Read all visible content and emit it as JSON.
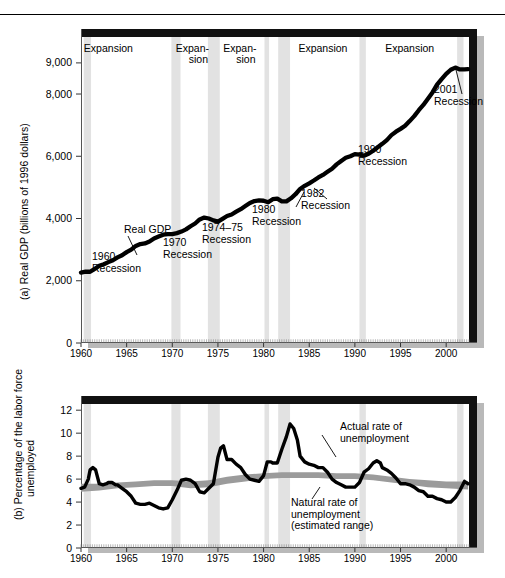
{
  "figure": {
    "top_rule": true,
    "panels": [
      "a",
      "b"
    ]
  },
  "panel_a": {
    "axis_label": "(a) Real GDP (billions  of 1996 dollars)",
    "y_ticks": [
      "0",
      "2,000",
      "4,000",
      "6,000",
      "8,000",
      "9,000"
    ],
    "y_tick_values": [
      0,
      2000,
      4000,
      6000,
      8000,
      9000
    ],
    "x_ticks": [
      "1960",
      "1965",
      "1970",
      "1975",
      "1980",
      "1985",
      "1990",
      "1995",
      "2000"
    ],
    "x_tick_values": [
      1960,
      1965,
      1970,
      1975,
      1980,
      1985,
      1990,
      1995,
      2000
    ],
    "series_label": "Real GDP",
    "expansion_labels": [
      {
        "text": "Expansion",
        "two_line": false,
        "year": 1963.0
      },
      {
        "text": "Expan-\nsion",
        "two_line": true,
        "year": 1972.2
      },
      {
        "text": "Expan-\nsion",
        "two_line": true,
        "year": 1977.4
      },
      {
        "text": "Expansion",
        "two_line": false,
        "year": 1986.5
      },
      {
        "text": "Expansion",
        "two_line": false,
        "year": 1996.0
      }
    ],
    "recession_callouts": [
      {
        "label": "1960\nRecession",
        "line1": "1960",
        "line2": "Recession"
      },
      {
        "label": "1970\nRecession",
        "line1": "1970",
        "line2": "Recession"
      },
      {
        "label": "1974–75\nRecession",
        "line1": "1974–75",
        "line2": "Recession"
      },
      {
        "label": "1980\nRecession",
        "line1": "1980",
        "line2": "Recession"
      },
      {
        "label": "1982\nRecession",
        "line1": "1982",
        "line2": "Recession"
      },
      {
        "label": "1990\nRecession",
        "line1": "1990",
        "line2": "Recession"
      },
      {
        "label": "2001\nRecession",
        "line1": "2001",
        "line2": "Recession"
      }
    ]
  },
  "panel_b": {
    "axis_label": "(b) Percentage of the labor force\nunemployed",
    "axis_label_line1": "(b) Percentage of the labor force",
    "axis_label_line2": "unemployed",
    "y_ticks": [
      "0",
      "2",
      "4",
      "6",
      "8",
      "10",
      "12"
    ],
    "y_tick_values": [
      0,
      2,
      4,
      6,
      8,
      10,
      12
    ],
    "x_ticks": [
      "1960",
      "1965",
      "1970",
      "1975",
      "1980",
      "1985",
      "1990",
      "1995",
      "2000"
    ],
    "x_tick_values": [
      1960,
      1965,
      1970,
      1975,
      1980,
      1985,
      1990,
      1995,
      2000
    ],
    "actual_label_line1": "Actual rate of",
    "actual_label_line2": "unemployment",
    "natural_label_line1": "Natural rate of",
    "natural_label_line2": "unemployment",
    "natural_label_line3": "(estimated range)"
  },
  "colors": {
    "line": "#000000",
    "recession_band": "#e2e2e2",
    "natural_band": "#9b9b9b",
    "frame": "#000000",
    "shadow": "#b4b4b4",
    "background": "#ffffff"
  },
  "recession_bands": [
    {
      "name": "1960 Recession",
      "start": 1960.3,
      "end": 1961.1
    },
    {
      "name": "1970 Recession",
      "start": 1969.9,
      "end": 1970.9
    },
    {
      "name": "1974–75 Recession",
      "start": 1973.9,
      "end": 1975.2
    },
    {
      "name": "1980 Recession",
      "start": 1980.1,
      "end": 1980.6
    },
    {
      "name": "1982 Recession",
      "start": 1981.6,
      "end": 1982.9
    },
    {
      "name": "1990 Recession",
      "start": 1990.5,
      "end": 1991.2
    },
    {
      "name": "2001 Recession",
      "start": 2001.2,
      "end": 2001.9
    }
  ],
  "chart_data": [
    {
      "type": "line",
      "id": "real-gdp",
      "title": "(a) Real GDP (billions of 1996 dollars)",
      "xlabel": "",
      "ylabel": "Real GDP (billions of 1996 dollars)",
      "xlim": [
        1960,
        2002.5
      ],
      "ylim": [
        0,
        9800
      ],
      "grid": false,
      "legend": "none",
      "series": [
        {
          "name": "Real GDP",
          "x": [
            1960.0,
            1960.5,
            1961.0,
            1961.5,
            1962.0,
            1962.5,
            1963.0,
            1963.5,
            1964.0,
            1964.5,
            1965.0,
            1965.5,
            1966.0,
            1966.5,
            1967.0,
            1967.5,
            1968.0,
            1968.5,
            1969.0,
            1969.5,
            1970.0,
            1970.5,
            1971.0,
            1971.5,
            1972.0,
            1972.5,
            1973.0,
            1973.5,
            1974.0,
            1974.5,
            1975.0,
            1975.5,
            1976.0,
            1976.5,
            1977.0,
            1977.5,
            1978.0,
            1978.5,
            1979.0,
            1979.5,
            1980.0,
            1980.5,
            1981.0,
            1981.5,
            1982.0,
            1982.5,
            1983.0,
            1983.5,
            1984.0,
            1984.5,
            1985.0,
            1985.5,
            1986.0,
            1986.5,
            1987.0,
            1987.5,
            1988.0,
            1988.5,
            1989.0,
            1989.5,
            1990.0,
            1990.5,
            1991.0,
            1991.5,
            1992.0,
            1992.5,
            1993.0,
            1993.5,
            1994.0,
            1994.5,
            1995.0,
            1995.5,
            1996.0,
            1996.5,
            1997.0,
            1997.5,
            1998.0,
            1998.5,
            1999.0,
            1999.5,
            2000.0,
            2000.5,
            2001.0,
            2001.5,
            2002.0,
            2002.4
          ],
          "y": [
            2263,
            2290,
            2290,
            2380,
            2480,
            2530,
            2600,
            2660,
            2750,
            2820,
            2920,
            3000,
            3120,
            3180,
            3200,
            3260,
            3360,
            3420,
            3480,
            3500,
            3500,
            3530,
            3580,
            3650,
            3750,
            3840,
            3970,
            4030,
            4000,
            3940,
            3900,
            3990,
            4080,
            4130,
            4220,
            4300,
            4400,
            4500,
            4560,
            4580,
            4570,
            4520,
            4620,
            4640,
            4550,
            4550,
            4650,
            4780,
            4950,
            5050,
            5130,
            5220,
            5320,
            5400,
            5500,
            5600,
            5740,
            5850,
            5950,
            6000,
            6070,
            6050,
            6020,
            6080,
            6180,
            6290,
            6400,
            6520,
            6680,
            6790,
            6880,
            6980,
            7130,
            7290,
            7480,
            7650,
            7850,
            8050,
            8300,
            8480,
            8650,
            8780,
            8850,
            8790,
            8790,
            8800
          ]
        }
      ],
      "annotations": [
        {
          "text": "Expansion",
          "x": 1963.0,
          "y_area": "top"
        },
        {
          "text": "Expan- sion",
          "x": 1972.2,
          "y_area": "top"
        },
        {
          "text": "Expan- sion",
          "x": 1977.4,
          "y_area": "top"
        },
        {
          "text": "Expansion",
          "x": 1986.5,
          "y_area": "top"
        },
        {
          "text": "Expansion",
          "x": 1996.0,
          "y_area": "top"
        },
        {
          "text": "Real GDP",
          "x": 1963.0,
          "y": 4000
        },
        {
          "text": "1960 Recession",
          "x": 1960.8,
          "y": 1500
        },
        {
          "text": "1970 Recession",
          "x": 1970.6,
          "y": 2700
        },
        {
          "text": "1974-75 Recession",
          "x": 1974.6,
          "y": 3350
        },
        {
          "text": "1980 Recession",
          "x": 1980.6,
          "y": 4150
        },
        {
          "text": "1982 Recession",
          "x": 1983.5,
          "y": 4500
        },
        {
          "text": "1990 Recession",
          "x": 1991.0,
          "y": 5700
        },
        {
          "text": "2001 Recession",
          "x": 1999.5,
          "y": 8050
        }
      ]
    },
    {
      "type": "line",
      "id": "unemployment-rate",
      "title": "(b) Percentage of the labor force unemployed",
      "xlabel": "",
      "ylabel": "Percentage of the labor force unemployed",
      "xlim": [
        1960,
        2002.5
      ],
      "ylim": [
        0,
        12.8
      ],
      "grid": false,
      "legend": "none",
      "series": [
        {
          "name": "Actual rate of unemployment",
          "x": [
            1960.0,
            1960.4,
            1960.8,
            1961.0,
            1961.3,
            1961.6,
            1962.0,
            1962.4,
            1962.8,
            1963.0,
            1963.4,
            1963.8,
            1964.0,
            1964.5,
            1965.0,
            1965.5,
            1966.0,
            1966.5,
            1967.0,
            1967.5,
            1968.0,
            1968.5,
            1969.0,
            1969.5,
            1970.0,
            1970.5,
            1971.0,
            1971.5,
            1972.0,
            1972.5,
            1973.0,
            1973.5,
            1974.0,
            1974.5,
            1975.0,
            1975.3,
            1975.6,
            1976.0,
            1976.5,
            1977.0,
            1977.5,
            1978.0,
            1978.5,
            1979.0,
            1979.5,
            1980.0,
            1980.4,
            1980.8,
            1981.0,
            1981.5,
            1982.0,
            1982.5,
            1982.9,
            1983.3,
            1983.7,
            1984.0,
            1984.5,
            1985.0,
            1985.5,
            1986.0,
            1986.5,
            1987.0,
            1987.5,
            1988.0,
            1988.5,
            1989.0,
            1989.5,
            1990.0,
            1990.5,
            1991.0,
            1991.5,
            1992.0,
            1992.4,
            1992.8,
            1993.0,
            1993.5,
            1994.0,
            1994.5,
            1995.0,
            1995.5,
            1996.0,
            1996.5,
            1997.0,
            1997.5,
            1998.0,
            1998.5,
            1999.0,
            1999.5,
            2000.0,
            2000.5,
            2001.0,
            2001.5,
            2002.0,
            2002.4
          ],
          "y": [
            5.2,
            5.3,
            6.0,
            6.8,
            7.0,
            6.8,
            5.6,
            5.5,
            5.6,
            5.7,
            5.7,
            5.5,
            5.5,
            5.2,
            4.9,
            4.5,
            3.9,
            3.8,
            3.8,
            3.9,
            3.7,
            3.5,
            3.4,
            3.5,
            4.2,
            5.0,
            5.9,
            6.0,
            5.9,
            5.6,
            4.9,
            4.8,
            5.2,
            5.6,
            7.9,
            8.7,
            8.9,
            7.7,
            7.7,
            7.3,
            7.0,
            6.4,
            6.0,
            5.9,
            5.8,
            6.3,
            7.5,
            7.5,
            7.4,
            7.4,
            8.6,
            9.7,
            10.8,
            10.4,
            9.4,
            8.0,
            7.5,
            7.3,
            7.2,
            7.0,
            7.0,
            6.6,
            6.0,
            5.7,
            5.5,
            5.3,
            5.3,
            5.3,
            5.7,
            6.6,
            6.9,
            7.4,
            7.6,
            7.4,
            7.0,
            6.8,
            6.5,
            6.1,
            5.6,
            5.6,
            5.5,
            5.3,
            5.0,
            4.9,
            4.5,
            4.5,
            4.3,
            4.2,
            4.0,
            4.0,
            4.4,
            5.0,
            5.8,
            5.6
          ]
        },
        {
          "name": "Natural rate of unemployment (estimated range)",
          "x": [
            1960,
            1962,
            1964,
            1966,
            1968,
            1970,
            1972,
            1974,
            1976,
            1978,
            1980,
            1982,
            1984,
            1986,
            1988,
            1990,
            1992,
            1994,
            1996,
            1998,
            2000,
            2002.4
          ],
          "y_low": [
            4.9,
            5.0,
            5.2,
            5.3,
            5.4,
            5.4,
            5.2,
            5.3,
            5.6,
            5.8,
            6.0,
            6.1,
            6.1,
            6.1,
            6.0,
            6.0,
            5.9,
            5.7,
            5.5,
            5.3,
            5.2,
            5.1
          ],
          "y_high": [
            5.6,
            5.6,
            5.7,
            5.8,
            5.9,
            5.9,
            5.8,
            5.9,
            6.2,
            6.4,
            6.5,
            6.6,
            6.6,
            6.6,
            6.5,
            6.5,
            6.4,
            6.2,
            6.0,
            5.9,
            5.8,
            5.8
          ]
        }
      ],
      "annotations": [
        {
          "text": "Actual rate of unemployment",
          "x": 1985.0,
          "y": 10.6
        },
        {
          "text": "Natural rate of unemployment (estimated range)",
          "x": 1985.5,
          "y": 4.3
        }
      ]
    }
  ]
}
